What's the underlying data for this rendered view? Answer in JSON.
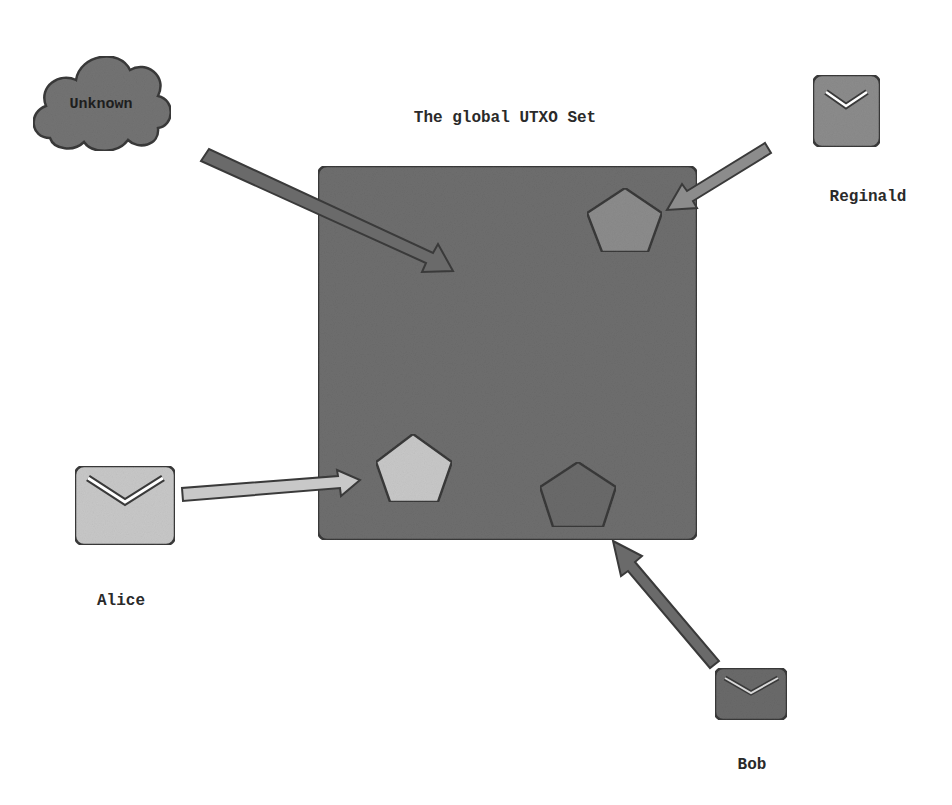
{
  "diagram": {
    "title": "The global UTXO Set",
    "colors": {
      "background": "#ffffff",
      "utxo_set_fill": "#6e6e6e",
      "outline": "#3a3a3a",
      "unknown_cloud": "#737373",
      "reginald": "#8c8c8c",
      "alice": "#c8c8c8",
      "bob": "#6a6a6a"
    },
    "nodes": [
      {
        "id": "unknown",
        "label": "Unknown",
        "shape": "cloud"
      },
      {
        "id": "reginald",
        "label": "Reginald",
        "shape": "envelope"
      },
      {
        "id": "alice",
        "label": "Alice",
        "shape": "envelope"
      },
      {
        "id": "bob",
        "label": "Bob",
        "shape": "envelope"
      }
    ],
    "utxo_set": {
      "label": "The global UTXO Set",
      "outputs": [
        {
          "owner": "reginald",
          "shape": "pentagon"
        },
        {
          "owner": "alice",
          "shape": "pentagon"
        },
        {
          "owner": "bob",
          "shape": "pentagon"
        }
      ]
    },
    "edges": [
      {
        "from": "unknown",
        "to": "utxo_set",
        "style": "arrow"
      },
      {
        "from": "reginald",
        "to": "utxo_set",
        "style": "arrow"
      },
      {
        "from": "alice",
        "to": "utxo_set",
        "style": "arrow"
      },
      {
        "from": "bob",
        "to": "utxo_set",
        "style": "arrow"
      }
    ]
  }
}
